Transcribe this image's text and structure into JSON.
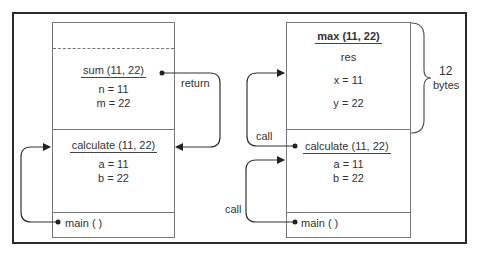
{
  "left_stack": {
    "frames": {
      "sum": {
        "header": "sum (11, 22)",
        "vars": [
          "n = 11",
          "m = 22"
        ]
      },
      "calculate": {
        "header": "calculate (11, 22)",
        "vars": [
          "a = 11",
          "b = 22"
        ]
      },
      "main": {
        "header": "main ( )"
      }
    },
    "arrows": {
      "return_label": "return"
    }
  },
  "right_stack": {
    "frames": {
      "max": {
        "header": "max (11, 22)",
        "vars": [
          "res",
          "x = 11",
          "y = 22"
        ]
      },
      "calculate": {
        "header": "calculate (11, 22)",
        "vars": [
          "a = 11",
          "b = 22"
        ]
      },
      "main": {
        "header": "main ( )"
      }
    },
    "arrows": {
      "call_upper_label": "call",
      "call_lower_label": "call"
    },
    "brace": {
      "size_value": "12",
      "size_unit": "bytes"
    }
  },
  "colors": {
    "frame_border": "#2a2a2a",
    "box_border": "#777777",
    "arrow": "#333333"
  }
}
